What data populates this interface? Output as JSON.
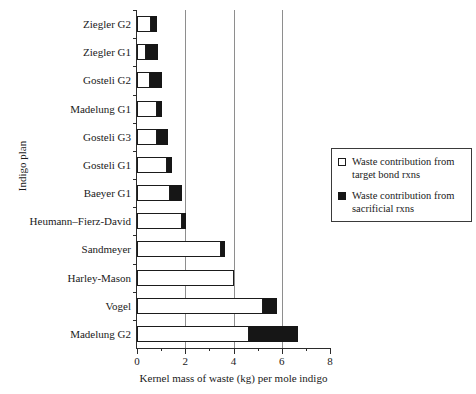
{
  "chart_data": {
    "type": "bar",
    "orientation": "horizontal",
    "stacked": true,
    "title": "",
    "xlabel": "Kernel mass of waste (kg) per mole indigo",
    "ylabel": "Indigo plan",
    "xlim": [
      0,
      8
    ],
    "xticks": [
      0,
      2,
      4,
      6,
      8
    ],
    "xticklabels": [
      "0",
      "2",
      "4",
      "6",
      "8"
    ],
    "minor_xticks": [
      1,
      3,
      5,
      7
    ],
    "grid": "vertical gridlines at 2, 4, 6",
    "legend_position": "right, outside plot area",
    "categories": [
      "Ziegler G2",
      "Ziegler G1",
      "Gosteli G2",
      "Madelung G1",
      "Gosteli G3",
      "Gosteli G1",
      "Baeyer G1",
      "Heumann–Fierz-David",
      "Sandmeyer",
      "Harley-Mason",
      "Vogel",
      "Madelung G2"
    ],
    "series": [
      {
        "name": "Waste contribution from target bond rxns",
        "color": "#ffffff",
        "values": [
          0.58,
          0.37,
          0.54,
          0.83,
          0.83,
          1.25,
          1.37,
          1.87,
          3.49,
          4.02,
          5.23,
          4.65
        ]
      },
      {
        "name": "Waste contribution from sacrificial rxns",
        "color": "#161616",
        "values": [
          0.25,
          0.5,
          0.5,
          0.21,
          0.46,
          0.21,
          0.5,
          0.17,
          0.17,
          0.0,
          0.58,
          2.03
        ]
      }
    ],
    "totals": [
      0.83,
      0.87,
      1.04,
      1.04,
      1.29,
      1.46,
      1.87,
      2.04,
      3.66,
      4.02,
      5.81,
      6.68
    ]
  },
  "legend": {
    "items": [
      {
        "swatch": "white",
        "label_line1": "Waste contribution from",
        "label_line2": "target bond rxns"
      },
      {
        "swatch": "black",
        "label_line1": "Waste contribution from",
        "label_line2": "sacrificial rxns"
      }
    ]
  }
}
